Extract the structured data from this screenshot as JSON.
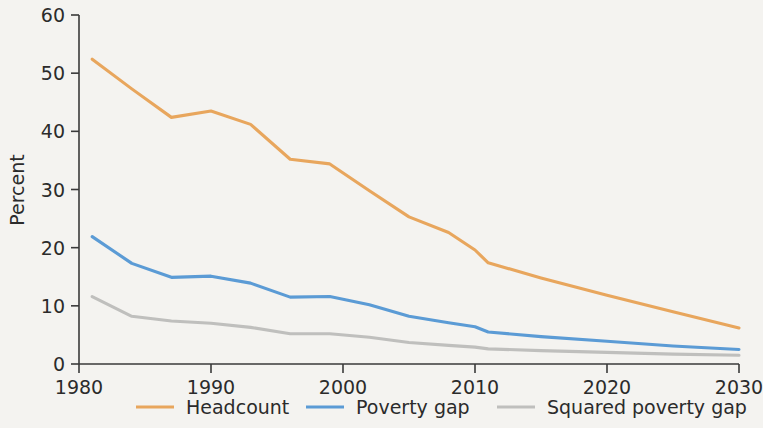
{
  "chart_data": {
    "type": "line",
    "title": "",
    "subtitle": "",
    "xlabel": "",
    "ylabel": "Percent",
    "xlim": [
      1980,
      2030
    ],
    "ylim": [
      0,
      60
    ],
    "xticks": [
      1980,
      1990,
      2000,
      2010,
      2020,
      2030
    ],
    "xtick_labels": [
      "1980",
      "1990",
      "2000",
      "2010",
      "2020",
      "2030"
    ],
    "yticks": [
      0,
      10,
      20,
      30,
      40,
      50,
      60
    ],
    "ytick_labels": [
      "0",
      "10",
      "20",
      "30",
      "40",
      "50",
      "60"
    ],
    "grid": false,
    "legend_position": "bottom",
    "series": [
      {
        "name": "Headcount",
        "color": "#e8a65d",
        "x": [
          1981,
          1984,
          1987,
          1990,
          1993,
          1996,
          1999,
          2002,
          2005,
          2008,
          2010,
          2011,
          2015,
          2020,
          2025,
          2030
        ],
        "values": [
          52.4,
          47.3,
          42.4,
          43.5,
          41.2,
          35.2,
          34.4,
          29.8,
          25.3,
          22.6,
          19.6,
          17.4,
          14.8,
          11.8,
          9.0,
          6.2
        ]
      },
      {
        "name": "Poverty gap",
        "color": "#5b9bd5",
        "x": [
          1981,
          1984,
          1987,
          1990,
          1993,
          1996,
          1999,
          2002,
          2005,
          2008,
          2010,
          2011,
          2015,
          2020,
          2025,
          2030
        ],
        "values": [
          21.9,
          17.3,
          14.9,
          15.1,
          13.9,
          11.5,
          11.6,
          10.2,
          8.2,
          7.1,
          6.4,
          5.5,
          4.7,
          3.9,
          3.1,
          2.5
        ]
      },
      {
        "name": "Squared poverty gap",
        "color": "#bfbfbd",
        "x": [
          1981,
          1984,
          1987,
          1990,
          1993,
          1996,
          1999,
          2002,
          2005,
          2008,
          2010,
          2011,
          2015,
          2020,
          2025,
          2030
        ],
        "values": [
          11.6,
          8.2,
          7.4,
          7.0,
          6.3,
          5.2,
          5.2,
          4.6,
          3.7,
          3.2,
          2.9,
          2.6,
          2.3,
          2.0,
          1.7,
          1.5
        ]
      }
    ]
  },
  "legend": {
    "items": [
      {
        "label": "Headcount",
        "color": "#e8a65d"
      },
      {
        "label": "Poverty gap",
        "color": "#5b9bd5"
      },
      {
        "label": "Squared poverty gap",
        "color": "#bfbfbd"
      }
    ]
  }
}
